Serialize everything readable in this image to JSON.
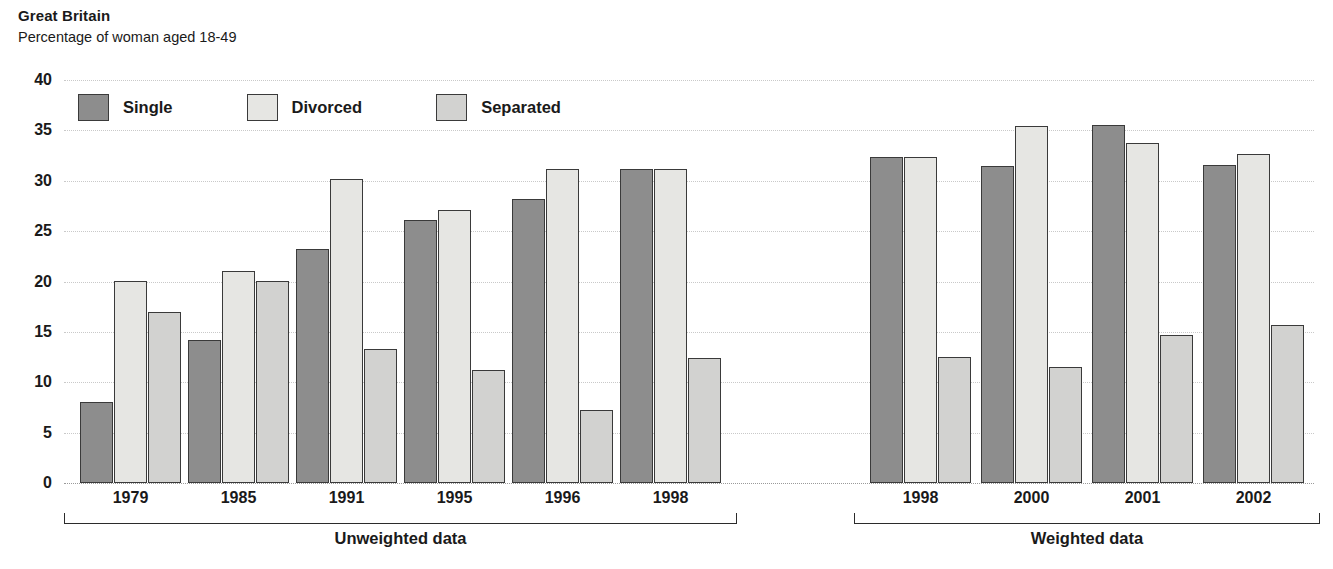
{
  "header": {
    "title": "Great Britain",
    "subtitle": "Percentage of woman aged 18-49"
  },
  "colors": {
    "single": "#8d8d8d",
    "divorced": "#e6e6e3",
    "separated": "#d2d2d0",
    "bar_edge": "#3a3a3a",
    "gridline": "#c9c9c9",
    "text": "#1a1a1a"
  },
  "legend": [
    {
      "label": "Single",
      "key": "single"
    },
    {
      "label": "Divorced",
      "key": "divorced"
    },
    {
      "label": "Separated",
      "key": "separated"
    }
  ],
  "panels": [
    {
      "label": "Unweighted data",
      "categories": [
        "1979",
        "1985",
        "1991",
        "1995",
        "1996",
        "1998"
      ]
    },
    {
      "label": "Weighted data",
      "categories": [
        "1998",
        "2000",
        "2001",
        "2002"
      ]
    }
  ],
  "yticks": [
    "0",
    "5",
    "10",
    "15",
    "20",
    "25",
    "30",
    "35",
    "40"
  ],
  "chart_data": {
    "type": "bar",
    "title": "Great Britain",
    "subtitle": "Percentage of woman aged 18-49",
    "xlabel": "",
    "ylabel": "Percentage of woman aged 18-49",
    "ylim": [
      0,
      40
    ],
    "ytick_step": 5,
    "grid": true,
    "legend_position": "top-left",
    "categories": [
      "1979",
      "1985",
      "1991",
      "1995",
      "1996",
      "1998",
      "1998",
      "2000",
      "2001",
      "2002"
    ],
    "group_panels": [
      "Unweighted data",
      "Unweighted data",
      "Unweighted data",
      "Unweighted data",
      "Unweighted data",
      "Unweighted data",
      "Weighted data",
      "Weighted data",
      "Weighted data",
      "Weighted data"
    ],
    "series": [
      {
        "name": "Single",
        "values": [
          8.0,
          14.2,
          23.2,
          26.1,
          28.2,
          31.2,
          32.4,
          31.5,
          35.5,
          31.6
        ]
      },
      {
        "name": "Divorced",
        "values": [
          20.1,
          21.0,
          30.2,
          27.1,
          31.2,
          31.2,
          32.4,
          35.4,
          33.7,
          32.7
        ]
      },
      {
        "name": "Separated",
        "values": [
          17.0,
          20.1,
          13.3,
          11.2,
          7.2,
          12.4,
          12.5,
          11.5,
          14.7,
          15.7
        ]
      }
    ]
  }
}
